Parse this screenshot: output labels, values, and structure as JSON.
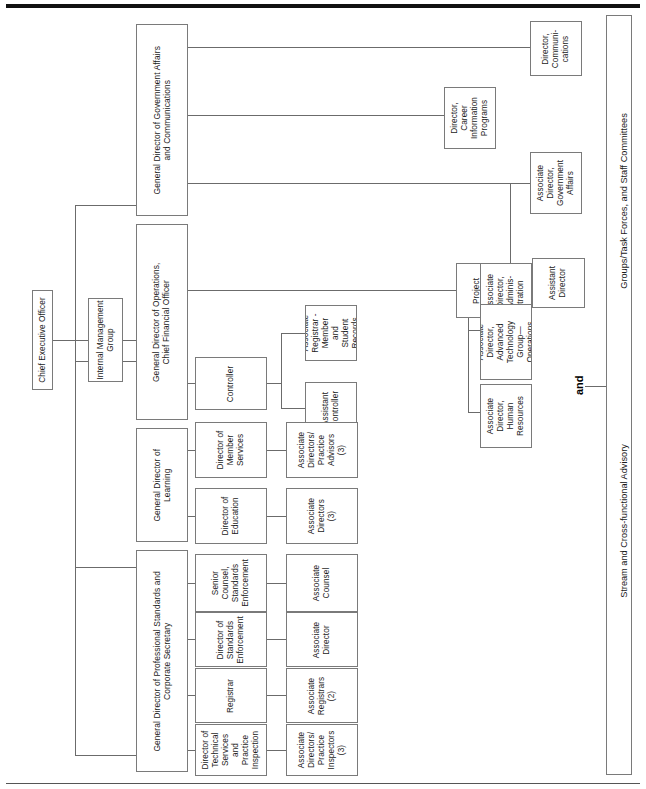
{
  "chart_type": "organization-chart",
  "orientation": "rotated-90-counterclockwise",
  "root": {
    "label": "Chief Executive Officer"
  },
  "staff_unit": {
    "label": "Internal Management\nGroup"
  },
  "general_directors": [
    {
      "id": "gd-gov-affairs",
      "label": "General Director of Government Affairs\nand Communications"
    },
    {
      "id": "gd-operations",
      "label": "General Director of Operations,\nChief Financial Officer"
    },
    {
      "id": "gd-learning",
      "label": "General Director of\nLearning"
    },
    {
      "id": "gd-prof-standards",
      "label": "General Director of Professional Standards and\nCorporate Secretary"
    }
  ],
  "directors": [
    {
      "id": "dir-communications",
      "label": "Director,\nCommuni-\ncations",
      "reports_to": "gd-gov-affairs"
    },
    {
      "id": "dir-career-info",
      "label": "Director,\nCareer\nInformation\nPrograms",
      "reports_to": "gd-gov-affairs"
    },
    {
      "id": "assoc-dir-gov-affairs",
      "label": "Associate\nDirector,\nGovernment\nAffairs",
      "reports_to": "gd-gov-affairs"
    },
    {
      "id": "project-director",
      "label": "Project\nDirector",
      "reports_to": "gd-operations"
    },
    {
      "id": "controller",
      "label": "Controller",
      "reports_to": "gd-operations"
    },
    {
      "id": "dir-member-services",
      "label": "Director of\nMember\nServices",
      "reports_to": "gd-learning"
    },
    {
      "id": "dir-education",
      "label": "Director of\nEducation",
      "reports_to": "gd-learning"
    },
    {
      "id": "senior-counsel",
      "label": "Senior\nCounsel,\nStandards\nEnforcement",
      "reports_to": "gd-prof-standards"
    },
    {
      "id": "dir-standards-enf",
      "label": "Director of\nStandards\nEnforcement",
      "reports_to": "gd-prof-standards"
    },
    {
      "id": "registrar",
      "label": "Registrar",
      "reports_to": "gd-prof-standards"
    },
    {
      "id": "dir-tech-services",
      "label": "Director of\nTechnical\nServices\nand\nPractice\nInspection",
      "reports_to": "gd-prof-standards"
    }
  ],
  "associates": [
    {
      "id": "assoc-dir-admin",
      "label": "Associate\nDirector,\nAdminis-\ntration",
      "reports_to": "project-director"
    },
    {
      "id": "assoc-dir-atg",
      "label": "Associate\nDirector,\nAdvanced\nTechnology\nGroup—\nOperations",
      "reports_to": "project-director"
    },
    {
      "id": "assoc-dir-hr",
      "label": "Associate\nDirector,\nHuman\nResources",
      "reports_to": "project-director"
    },
    {
      "id": "assoc-registrar-member",
      "label": "Associate\nRegistrar -\nMember\nand\nStudent\nRecords",
      "reports_to": "controller"
    },
    {
      "id": "assistant-controller",
      "label": "Assistant\nController",
      "reports_to": "controller"
    },
    {
      "id": "assoc-dirs-practice-advisors",
      "label": "Associate\nDirectors/\nPractice\nAdvisors\n(3)",
      "reports_to": "dir-member-services"
    },
    {
      "id": "assoc-directors-3",
      "label": "Associate\nDirectors\n(3)",
      "reports_to": "dir-education"
    },
    {
      "id": "assoc-counsel",
      "label": "Associate\nCounsel",
      "reports_to": "senior-counsel"
    },
    {
      "id": "assoc-director",
      "label": "Associate\nDirector",
      "reports_to": "dir-standards-enf"
    },
    {
      "id": "assoc-registrars-2",
      "label": "Associate\nRegistrars\n(2)",
      "reports_to": "registrar"
    },
    {
      "id": "assoc-dirs-practice-inspectors",
      "label": "Associate\nDirectors/\nPractice\nInspectors\n(3)",
      "reports_to": "dir-tech-services"
    },
    {
      "id": "assistant-director",
      "label": "Assistant\nDirector",
      "reports_to": "assoc-dir-gov-affairs"
    }
  ],
  "committees_bar": {
    "left_label": "Stream and Cross-functional Advisory",
    "right_label": "Groups/Task Forces, and Staff Committees",
    "connector_word": "and"
  },
  "colors": {
    "box_border": "#7a7a7a",
    "line": "#6b6b6b",
    "text": "#1a1a1a",
    "rule": "#111111",
    "background": "#ffffff"
  }
}
